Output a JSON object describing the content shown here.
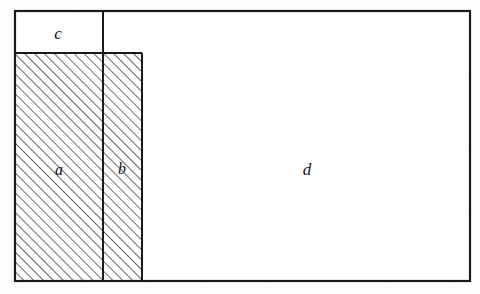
{
  "figure": {
    "background_color": "#fdfdfc",
    "line_color": "#1a1a1a",
    "hatch_color": "#2b2b2b",
    "label_color": "#141414",
    "canvas": {
      "width": 480,
      "height": 294
    },
    "outer_rect": {
      "x": 15,
      "y": 11,
      "width": 455,
      "height": 270,
      "stroke_width": 2.2
    },
    "hatch": {
      "angle_degrees": 45,
      "direction": "lower-left to upper-right",
      "spacing_px": 7,
      "stroke_width": 1.4
    },
    "regions": [
      {
        "id": "region-c",
        "label": "c",
        "hatched": false,
        "x": 15,
        "y": 11,
        "width": 88,
        "height": 42,
        "label_x": 58,
        "label_y": 39,
        "label_font_size": 17
      },
      {
        "id": "region-a",
        "label": "a",
        "hatched": true,
        "x": 16,
        "y": 53,
        "width": 87,
        "height": 227,
        "label_x": 59,
        "label_y": 175,
        "label_font_size": 16
      },
      {
        "id": "region-b",
        "label": "b",
        "hatched": true,
        "x": 103,
        "y": 53,
        "width": 39,
        "height": 227,
        "label_x": 122,
        "label_y": 174,
        "label_font_size": 16
      },
      {
        "id": "region-d",
        "label": "d",
        "hatched": false,
        "x": 142,
        "y": 11,
        "width": 328,
        "height": 270,
        "label_x": 307,
        "label_y": 175,
        "label_font_size": 17
      }
    ],
    "internal_edges": [
      {
        "id": "edge-c-bottom",
        "x1": 15,
        "y1": 53,
        "x2": 142,
        "y2": 53,
        "stroke_width": 2.0
      },
      {
        "id": "edge-c-right-ab-divider",
        "x1": 103,
        "y1": 11,
        "x2": 103,
        "y2": 280,
        "stroke_width": 2.0
      },
      {
        "id": "edge-b-right",
        "x1": 142,
        "y1": 53,
        "x2": 142,
        "y2": 280,
        "stroke_width": 2.0
      }
    ]
  }
}
